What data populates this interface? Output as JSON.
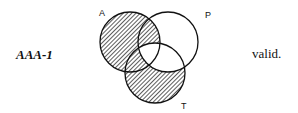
{
  "form": {
    "name": "AAA-1",
    "verdict": "valid."
  },
  "diagram": {
    "circles": [
      {
        "label": "A",
        "cx": 130,
        "cy": 42,
        "r": 30
      },
      {
        "label": "P",
        "cx": 168,
        "cy": 42,
        "r": 30
      },
      {
        "label": "T",
        "cx": 155,
        "cy": 73,
        "r": 30
      }
    ],
    "shaded_regions": [
      "A only",
      "A and P not T",
      "A and T not P",
      "T only"
    ],
    "unshaded_regions": [
      "A and P and T",
      "P only",
      "P and T not A"
    ]
  }
}
